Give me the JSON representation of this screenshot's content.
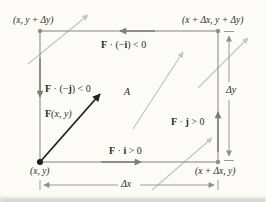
{
  "figure": {
    "title_semantic": "flux-of-vector-field-across-rectangle-diagram",
    "corners": {
      "top_left": "(x, y + Δy)",
      "top_right": "(x + Δx, y + Δy)",
      "bottom_left": "(x, y)",
      "bottom_right": "(x + Δx, y)"
    },
    "flux_labels": {
      "top": {
        "f": "F",
        "mid": " · (−",
        "vec": "i",
        "end": ") < 0"
      },
      "left": {
        "f": "F",
        "mid": " · (−",
        "vec": "j",
        "end": ") < 0"
      },
      "right": {
        "f": "F",
        "mid": " · ",
        "vec": "j",
        "end": " > 0"
      },
      "bottom": {
        "f": "F",
        "mid": " · ",
        "vec": "i",
        "end": " > 0"
      }
    },
    "vector_label": {
      "f": "F",
      "args": "(x, y)"
    },
    "area_label": "A",
    "dimensions": {
      "width": "Δx",
      "height": "Δy"
    },
    "colors": {
      "paper": "#fcfbf7",
      "ink": "#2e2c29",
      "edge_gray": "#8e8e8c",
      "flux_arrow_gray": "#7d7d7a",
      "field_arrow_gray": "#c6c6c2",
      "dimension_gray": "#8e8e8c",
      "vector_black": "#222222"
    }
  }
}
